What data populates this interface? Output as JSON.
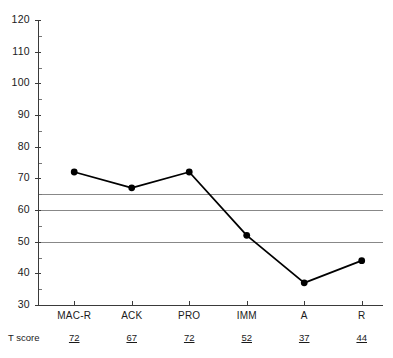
{
  "chart_data": {
    "type": "line",
    "title": "",
    "subtitle": "",
    "xlabel": "",
    "ylabel": "",
    "categories": [
      "MAC-R",
      "ACK",
      "PRO",
      "IMM",
      "A",
      "R"
    ],
    "values": [
      72,
      67,
      72,
      52,
      37,
      44
    ],
    "series": [
      {
        "name": "T score",
        "values": [
          72,
          67,
          72,
          52,
          37,
          44
        ]
      }
    ],
    "ylim": [
      30,
      120
    ],
    "xlim": [
      0,
      6
    ],
    "y_major_ticks": [
      30,
      40,
      50,
      60,
      70,
      80,
      90,
      100,
      110,
      120
    ],
    "y_minor_ticks": [
      35,
      45,
      55,
      65,
      75,
      85,
      95,
      105,
      115
    ],
    "y_tick_labels": [
      "30",
      "40",
      "50",
      "60",
      "70",
      "80",
      "90",
      "100",
      "110",
      "120"
    ],
    "grid": false,
    "legend": "none",
    "reference_lines": [
      {
        "value": 65,
        "color": "#888888"
      },
      {
        "value": 60,
        "color": "#888888"
      },
      {
        "value": 50,
        "color": "#888888"
      }
    ],
    "marker": "filled-circle",
    "line_color": "#000000",
    "marker_color": "#000000"
  },
  "axis": {
    "y_labels": [
      "120",
      "110",
      "100",
      "90",
      "80",
      "70",
      "60",
      "50",
      "40",
      "30"
    ],
    "x_labels": [
      "MAC-R",
      "ACK",
      "PRO",
      "IMM",
      "A",
      "R"
    ]
  },
  "table": {
    "row_caption": "T score",
    "values": [
      "72",
      "67",
      "72",
      "52",
      "37",
      "44"
    ]
  },
  "colors": {
    "axis": "#3a3a3a",
    "line": "#000000",
    "marker": "#000000",
    "reference_line": "#888888",
    "text": "#1a1a1a",
    "background": "#ffffff"
  }
}
